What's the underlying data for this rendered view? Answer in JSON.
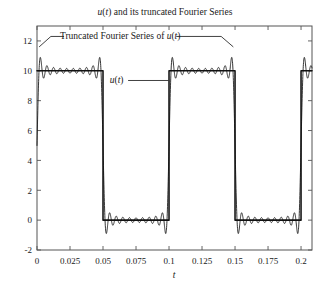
{
  "chart_data": {
    "type": "line",
    "title": "u(t) and its truncated Fourier Series",
    "title_parts": {
      "italic_u": "u",
      "paren_open": "(",
      "italic_t": "t",
      "rest": ") and its truncated Fourier Series"
    },
    "xlabel": "t",
    "ylabel": "",
    "xlim": [
      0,
      0.2083
    ],
    "ylim": [
      -2,
      13
    ],
    "grid": false,
    "legend_position": "none",
    "xticks": [
      0,
      0.025,
      0.05,
      0.075,
      0.1,
      0.125,
      0.15,
      0.175,
      0.2
    ],
    "xtick_labels": [
      "0",
      "0.025",
      "0.05",
      "0.075",
      "0.1",
      "0.125",
      "0.15",
      "0.175",
      "0.2"
    ],
    "yticks": [
      -2,
      0,
      2,
      4,
      6,
      8,
      10,
      12
    ],
    "ytick_labels": [
      "-2",
      "0",
      "2",
      "4",
      "6",
      "8",
      "10",
      "12"
    ],
    "square_wave": {
      "amplitude": 10,
      "low_value": 0,
      "period": 0.1,
      "duty_cycle": 0.5,
      "description": "u(t) periodic square wave: 10 for 0<t<0.05, 0 for 0.05<t<0.1, repeating"
    },
    "fourier_series": {
      "harmonics": 19,
      "overshoot_peak": 11.8,
      "undershoot_min": -1.2,
      "description": "Truncated Fourier Series of u(t) with Gibbs phenomenon ringing"
    },
    "annotations": [
      {
        "name": "fourier-annotation",
        "text": "Truncated Fourier Series of u(t)",
        "text_parts": {
          "main": "Truncated Fourier Series of ",
          "italic_u": "u",
          "paren_open": "(",
          "italic_t": "t",
          "paren_close": ")"
        },
        "x": 0.063,
        "y": 12.1
      },
      {
        "name": "ut-annotation",
        "text": "u(t)",
        "text_parts": {
          "italic_u": "u",
          "paren_open": "(",
          "italic_t": "t",
          "paren_close": ")"
        },
        "x": 0.0655,
        "y": 9.15
      }
    ],
    "colors": {
      "line": "#111111",
      "frame": "#555555",
      "text": "#1a1a1a",
      "background": "#ffffff"
    }
  }
}
